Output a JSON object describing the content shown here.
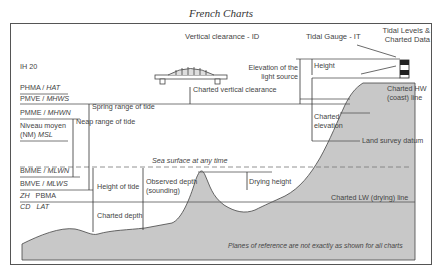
{
  "title": "French Charts",
  "header_labels": {
    "vertical_clearance": "Vertical clearance - ID",
    "tidal_gauge": "Tidal Gauge - IT",
    "tidal_levels_1": "Tidal Levels &",
    "tidal_levels_2": "Charted Data",
    "ih": "IH 20"
  },
  "datum_labels": {
    "phma": "PHMA / ",
    "hat": "HAT",
    "pmve": "PMVE / ",
    "mhws": "MHWS",
    "pmme": "PMME / ",
    "mhwn": "MHWN",
    "nm1": "Niveau moyen",
    "nm2": "(NM) ",
    "msl": "MSL",
    "bmme": "BMME / ",
    "mlwn": "MLWN",
    "bmve": "BMVE / ",
    "mlws": "MLWS",
    "zh": "ZH",
    "pbma": "PBMA",
    "cd": "CD",
    "lat": "LAT"
  },
  "measure_labels": {
    "spring_range": "Spring range of tide",
    "neap_range": "Neap range of tide",
    "height_of_tide": "Height of tide",
    "observed_depth_1": "Observed depth",
    "observed_depth_2": "(sounding)",
    "charted_depth": "Charted depth",
    "charted_vertical_clearance": "Charted vertical clearance",
    "elevation_light_1": "Elevation of the",
    "elevation_light_2": "light source",
    "height": "Height",
    "charted_elevation_1": "Charted",
    "charted_elevation_2": "elevation",
    "charted_hw_1": "Charted HW",
    "charted_hw_2": "(coast) line",
    "land_survey_datum": "Land survey datum",
    "sea_surface": "Sea surface at any time",
    "drying_height": "Drying height",
    "charted_lw": "Charted LW (drying) line",
    "footnote": "Planes of reference are not exactly as shown for all charts"
  },
  "colors": {
    "land": "#c8c8c8",
    "line": "#444444",
    "frame": "#555555"
  }
}
